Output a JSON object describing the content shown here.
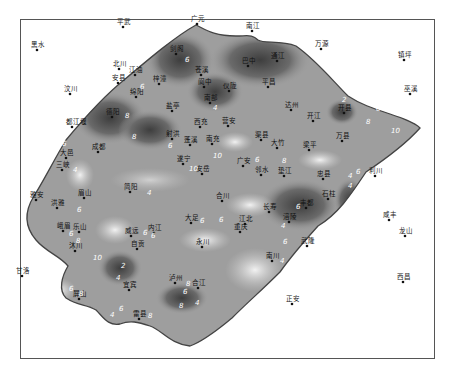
{
  "map": {
    "title": "Contour map of region (values 2–10)",
    "frame": {
      "x": 20,
      "y": 19,
      "w": 415,
      "h": 340
    },
    "colors": {
      "basin_dark": "#4a4a4a",
      "basin_mid": "#8a8a8a",
      "basin_light": "#d6d6d6",
      "outline": "#444444",
      "background": "#ffffff"
    },
    "outside_places": [
      {
        "name": "平武",
        "x": 123,
        "y": 27
      },
      {
        "name": "广元",
        "x": 197,
        "y": 24
      },
      {
        "name": "南江",
        "x": 252,
        "y": 31
      },
      {
        "name": "黑水",
        "x": 37,
        "y": 50
      },
      {
        "name": "万源",
        "x": 321,
        "y": 49
      },
      {
        "name": "镇坪",
        "x": 404,
        "y": 60
      },
      {
        "name": "北川",
        "x": 119,
        "y": 69
      },
      {
        "name": "安县",
        "x": 118,
        "y": 83
      },
      {
        "name": "汶川",
        "x": 70,
        "y": 94
      },
      {
        "name": "巫溪",
        "x": 410,
        "y": 94
      },
      {
        "name": "利川",
        "x": 375,
        "y": 176
      },
      {
        "name": "咸丰",
        "x": 389,
        "y": 220
      },
      {
        "name": "龙山",
        "x": 405,
        "y": 236
      },
      {
        "name": "西昌",
        "x": 403,
        "y": 282
      },
      {
        "name": "正安",
        "x": 292,
        "y": 304
      },
      {
        "name": "甘洛",
        "x": 22,
        "y": 276
      }
    ],
    "inside_places": [
      {
        "name": "剑阁",
        "x": 176,
        "y": 54
      },
      {
        "name": "巴中",
        "x": 248,
        "y": 66
      },
      {
        "name": "通江",
        "x": 277,
        "y": 61
      },
      {
        "name": "江油",
        "x": 135,
        "y": 75
      },
      {
        "name": "梓潼",
        "x": 159,
        "y": 84
      },
      {
        "name": "苍溪",
        "x": 201,
        "y": 75
      },
      {
        "name": "阆中",
        "x": 204,
        "y": 87
      },
      {
        "name": "仪陇",
        "x": 229,
        "y": 91
      },
      {
        "name": "平昌",
        "x": 268,
        "y": 87
      },
      {
        "name": "绵阳",
        "x": 136,
        "y": 97
      },
      {
        "name": "南部",
        "x": 210,
        "y": 103
      },
      {
        "name": "达州",
        "x": 291,
        "y": 110
      },
      {
        "name": "开县",
        "x": 344,
        "y": 113
      },
      {
        "name": "盐亭",
        "x": 172,
        "y": 111
      },
      {
        "name": "德阳",
        "x": 112,
        "y": 117
      },
      {
        "name": "开江",
        "x": 313,
        "y": 121
      },
      {
        "name": "西充",
        "x": 200,
        "y": 127
      },
      {
        "name": "营安",
        "x": 228,
        "y": 126
      },
      {
        "name": "万县",
        "x": 342,
        "y": 141
      },
      {
        "name": "都江堰",
        "x": 72,
        "y": 127
      },
      {
        "name": "射洪",
        "x": 172,
        "y": 139
      },
      {
        "name": "蓬溪",
        "x": 190,
        "y": 145
      },
      {
        "name": "南充",
        "x": 212,
        "y": 144
      },
      {
        "name": "渠县",
        "x": 261,
        "y": 140
      },
      {
        "name": "大竹",
        "x": 277,
        "y": 148
      },
      {
        "name": "梁平",
        "x": 309,
        "y": 150
      },
      {
        "name": "成都",
        "x": 98,
        "y": 152
      },
      {
        "name": "大邑",
        "x": 66,
        "y": 158
      },
      {
        "name": "三峡",
        "x": 62,
        "y": 170
      },
      {
        "name": "遂宁",
        "x": 183,
        "y": 164
      },
      {
        "name": "安岳",
        "x": 202,
        "y": 174
      },
      {
        "name": "广安",
        "x": 243,
        "y": 166
      },
      {
        "name": "邻水",
        "x": 261,
        "y": 175
      },
      {
        "name": "垫江",
        "x": 284,
        "y": 176
      },
      {
        "name": "忠县",
        "x": 323,
        "y": 179
      },
      {
        "name": "简阳",
        "x": 130,
        "y": 192
      },
      {
        "name": "雅安",
        "x": 36,
        "y": 200
      },
      {
        "name": "眉山",
        "x": 84,
        "y": 198
      },
      {
        "name": "合川",
        "x": 222,
        "y": 201
      },
      {
        "name": "洪雅",
        "x": 57,
        "y": 208
      },
      {
        "name": "石柱",
        "x": 328,
        "y": 199
      },
      {
        "name": "丰都",
        "x": 306,
        "y": 208
      },
      {
        "name": "长寿",
        "x": 269,
        "y": 212
      },
      {
        "name": "大足",
        "x": 191,
        "y": 223
      },
      {
        "name": "江北",
        "x": 245,
        "y": 224
      },
      {
        "name": "重庆",
        "x": 240,
        "y": 232
      },
      {
        "name": "涪陵",
        "x": 289,
        "y": 222
      },
      {
        "name": "峨眉",
        "x": 63,
        "y": 231
      },
      {
        "name": "乐山",
        "x": 79,
        "y": 232
      },
      {
        "name": "威远",
        "x": 131,
        "y": 236
      },
      {
        "name": "内江",
        "x": 154,
        "y": 233
      },
      {
        "name": "自贡",
        "x": 137,
        "y": 249
      },
      {
        "name": "永川",
        "x": 202,
        "y": 247
      },
      {
        "name": "南川",
        "x": 272,
        "y": 261
      },
      {
        "name": "武隆",
        "x": 307,
        "y": 246
      },
      {
        "name": "沐川",
        "x": 75,
        "y": 251
      },
      {
        "name": "宜宾",
        "x": 129,
        "y": 290
      },
      {
        "name": "泸州",
        "x": 175,
        "y": 283
      },
      {
        "name": "合江",
        "x": 198,
        "y": 288
      },
      {
        "name": "屏山",
        "x": 79,
        "y": 299
      },
      {
        "name": "雷县",
        "x": 139,
        "y": 319
      }
    ],
    "contour_labels": [
      {
        "v": "6",
        "x": 185,
        "y": 62
      },
      {
        "v": "6",
        "x": 140,
        "y": 89
      },
      {
        "v": "8",
        "x": 125,
        "y": 118
      },
      {
        "v": "4",
        "x": 213,
        "y": 110
      },
      {
        "v": "2",
        "x": 342,
        "y": 102
      },
      {
        "v": "4",
        "x": 355,
        "y": 100
      },
      {
        "v": "6",
        "x": 376,
        "y": 111
      },
      {
        "v": "8",
        "x": 366,
        "y": 124
      },
      {
        "v": "10",
        "x": 391,
        "y": 133
      },
      {
        "v": "6",
        "x": 168,
        "y": 148
      },
      {
        "v": "10",
        "x": 213,
        "y": 158
      },
      {
        "v": "10",
        "x": 189,
        "y": 171
      },
      {
        "v": "6",
        "x": 255,
        "y": 162
      },
      {
        "v": "8",
        "x": 282,
        "y": 163
      },
      {
        "v": "6",
        "x": 356,
        "y": 174
      },
      {
        "v": "4",
        "x": 348,
        "y": 178
      },
      {
        "v": "4",
        "x": 348,
        "y": 188
      },
      {
        "v": "4",
        "x": 147,
        "y": 195
      },
      {
        "v": "8",
        "x": 132,
        "y": 139
      },
      {
        "v": "6",
        "x": 62,
        "y": 146
      },
      {
        "v": "4",
        "x": 73,
        "y": 172
      },
      {
        "v": "6",
        "x": 77,
        "y": 212
      },
      {
        "v": "6",
        "x": 69,
        "y": 236
      },
      {
        "v": "8",
        "x": 76,
        "y": 243
      },
      {
        "v": "10",
        "x": 93,
        "y": 260
      },
      {
        "v": "6",
        "x": 143,
        "y": 235
      },
      {
        "v": "6",
        "x": 151,
        "y": 238
      },
      {
        "v": "6",
        "x": 200,
        "y": 223
      },
      {
        "v": "6",
        "x": 219,
        "y": 222
      },
      {
        "v": "6",
        "x": 296,
        "y": 209
      },
      {
        "v": "4",
        "x": 281,
        "y": 228
      },
      {
        "v": "6",
        "x": 283,
        "y": 244
      },
      {
        "v": "4",
        "x": 280,
        "y": 263
      },
      {
        "v": "2",
        "x": 121,
        "y": 268
      },
      {
        "v": "4",
        "x": 116,
        "y": 280
      },
      {
        "v": "6",
        "x": 69,
        "y": 291
      },
      {
        "v": "8",
        "x": 79,
        "y": 296
      },
      {
        "v": "6",
        "x": 119,
        "y": 311
      },
      {
        "v": "4",
        "x": 110,
        "y": 317
      },
      {
        "v": "8",
        "x": 148,
        "y": 318
      },
      {
        "v": "8",
        "x": 186,
        "y": 286
      },
      {
        "v": "6",
        "x": 183,
        "y": 294
      },
      {
        "v": "8",
        "x": 179,
        "y": 308
      },
      {
        "v": "4",
        "x": 195,
        "y": 305
      }
    ],
    "caption": ""
  }
}
